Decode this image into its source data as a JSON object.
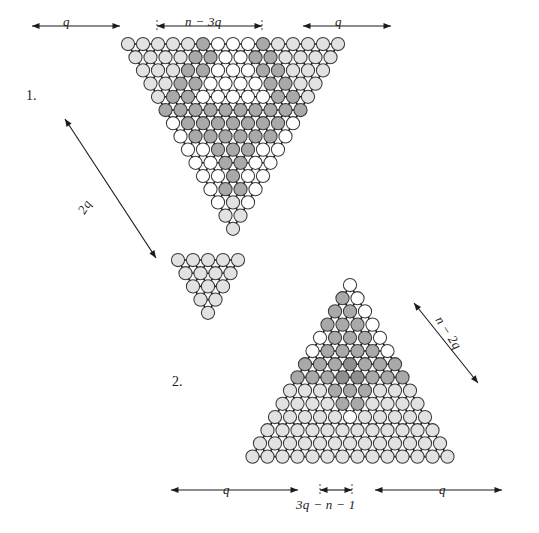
{
  "figure": {
    "background_color": "#ffffff",
    "colors": {
      "node_white": "#ffffff",
      "node_light": "#e2e2e2",
      "node_mid": "#a9a9a9",
      "node_dark": "#8f8f8f",
      "outline": "#3a3a3a",
      "bond": "#111111",
      "text": "#1b1b1b"
    }
  },
  "panels": [
    {
      "id": "panel-1",
      "number_label": "1.",
      "orientation": "inverted-triangle",
      "rows": 15,
      "top_width": 28,
      "dimension_labels": [
        {
          "name": "top-left-q",
          "text": "q",
          "position": "top-left"
        },
        {
          "name": "top-middle",
          "text": "n − 3q",
          "position": "top-middle"
        },
        {
          "name": "top-right-q",
          "text": "q",
          "position": "top-right"
        },
        {
          "name": "left-diagonal",
          "text": "2q",
          "position": "left-diagonal"
        }
      ]
    },
    {
      "id": "panel-2",
      "number_label": "2.",
      "orientation": "upright-triangle",
      "rows": 14,
      "base_width": 27,
      "dimension_labels": [
        {
          "name": "bottom-left-q",
          "text": "q",
          "position": "bottom-left"
        },
        {
          "name": "bottom-middle",
          "text": "3q − n − 1",
          "position": "bottom-middle"
        },
        {
          "name": "bottom-right-q",
          "text": "q",
          "position": "bottom-right"
        },
        {
          "name": "right-diagonal",
          "text": "n − 2q",
          "position": "right-diagonal"
        }
      ]
    },
    {
      "id": "panel-1-detached-tip",
      "number_label": "",
      "orientation": "inverted-triangle-tip",
      "rows": 5,
      "dimension_labels": []
    }
  ],
  "labels": {
    "panel1_number": "1.",
    "panel2_number": "2.",
    "q_top_left": "q",
    "n_minus_3q": "n − 3q",
    "q_top_right": "q",
    "two_q": "2q",
    "q_bottom_left": "q",
    "three_q_minus_n_minus_1": "3q − n − 1",
    "q_bottom_right": "q",
    "n_minus_2q": "n − 2q"
  },
  "legend": {
    "shades": [
      {
        "name": "unshaded",
        "color": "#ffffff",
        "meaning": "white"
      },
      {
        "name": "light-shaded",
        "color": "#e2e2e2",
        "meaning": "light gray"
      },
      {
        "name": "mid-shaded",
        "color": "#a9a9a9",
        "meaning": "medium gray"
      },
      {
        "name": "dark-shaded",
        "color": "#8f8f8f",
        "meaning": "dark gray"
      }
    ]
  }
}
